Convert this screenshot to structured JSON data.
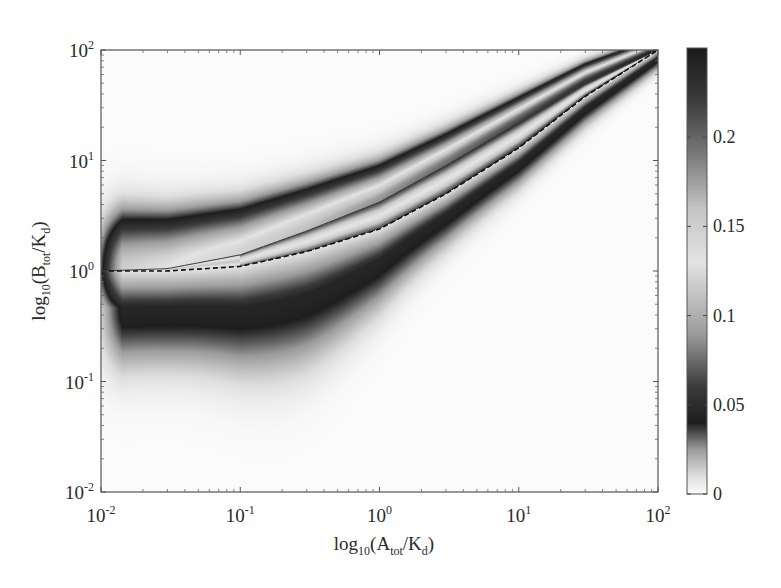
{
  "chart_data": {
    "type": "heatmap",
    "title": "",
    "xlabel": {
      "prefix": "log",
      "sub1": "10",
      "open": "(A",
      "sub2": "tot",
      "mid": "/K",
      "sub3": "d",
      "close": ")"
    },
    "ylabel": {
      "prefix": "log",
      "sub1": "10",
      "open": "(B",
      "sub2": "tot",
      "mid": "/K",
      "sub3": "d",
      "close": ")"
    },
    "x_scale": "log",
    "y_scale": "log",
    "xlim": [
      0.01,
      100
    ],
    "ylim": [
      0.01,
      100
    ],
    "x_ticks": [
      {
        "value": 0.01,
        "base": "10",
        "exp": "-2"
      },
      {
        "value": 0.1,
        "base": "10",
        "exp": "-1"
      },
      {
        "value": 1,
        "base": "10",
        "exp": "0"
      },
      {
        "value": 10,
        "base": "10",
        "exp": "1"
      },
      {
        "value": 100,
        "base": "10",
        "exp": "2"
      }
    ],
    "y_ticks": [
      {
        "value": 0.01,
        "base": "10",
        "exp": "-2"
      },
      {
        "value": 0.1,
        "base": "10",
        "exp": "-1"
      },
      {
        "value": 1,
        "base": "10",
        "exp": "0"
      },
      {
        "value": 10,
        "base": "10",
        "exp": "1"
      },
      {
        "value": 100,
        "base": "10",
        "exp": "2"
      }
    ],
    "grid": false,
    "colorbar": {
      "placement": "right",
      "range": [
        0,
        0.25
      ],
      "ticks": [
        {
          "value": 0,
          "label": "0"
        },
        {
          "value": 0.05,
          "label": "0.05"
        },
        {
          "value": 0.1,
          "label": "0.1"
        },
        {
          "value": 0.15,
          "label": "0.15"
        },
        {
          "value": 0.2,
          "label": "0.2"
        }
      ],
      "colormap_stops": [
        {
          "value": 0.0,
          "color": "#fbfbfb"
        },
        {
          "value": 0.01,
          "color": "#dedede"
        },
        {
          "value": 0.025,
          "color": "#9a9a9a"
        },
        {
          "value": 0.04,
          "color": "#1e1e1e"
        },
        {
          "value": 0.06,
          "color": "#3a3a3a"
        },
        {
          "value": 0.09,
          "color": "#9c9c9c"
        },
        {
          "value": 0.13,
          "color": "#e3e3e3"
        },
        {
          "value": 0.16,
          "color": "#c4c4c4"
        },
        {
          "value": 0.19,
          "color": "#7a7a7a"
        },
        {
          "value": 0.22,
          "color": "#3c3c3c"
        },
        {
          "value": 0.25,
          "color": "#1a1a1a"
        }
      ]
    },
    "series": [
      {
        "name": "solid-curve",
        "style": "solid",
        "color": "#3a3a3a",
        "points": [
          [
            0.01,
            1.0
          ],
          [
            0.03,
            1.05
          ],
          [
            0.1,
            1.4
          ],
          [
            0.3,
            2.3
          ],
          [
            1,
            4.2
          ],
          [
            3,
            9.0
          ],
          [
            10,
            22
          ],
          [
            30,
            50
          ],
          [
            100,
            100
          ]
        ]
      },
      {
        "name": "dashed-curve",
        "style": "dashed",
        "color": "#111111",
        "points": [
          [
            0.01,
            1.0
          ],
          [
            0.03,
            1.0
          ],
          [
            0.1,
            1.1
          ],
          [
            0.3,
            1.5
          ],
          [
            1,
            2.4
          ],
          [
            3,
            5.0
          ],
          [
            10,
            13
          ],
          [
            30,
            38
          ],
          [
            100,
            100
          ]
        ]
      }
    ],
    "field_description": "Value peaks in a band around the curves; max ~0.25 near y≈x at large A, dark ring ~0.04 beneath the dashed curve with trough near x≈0.3-1, y≈0.6; fades to 0 away from the band (lower boundary reaches y≈0.07 near x≈0.25)."
  }
}
